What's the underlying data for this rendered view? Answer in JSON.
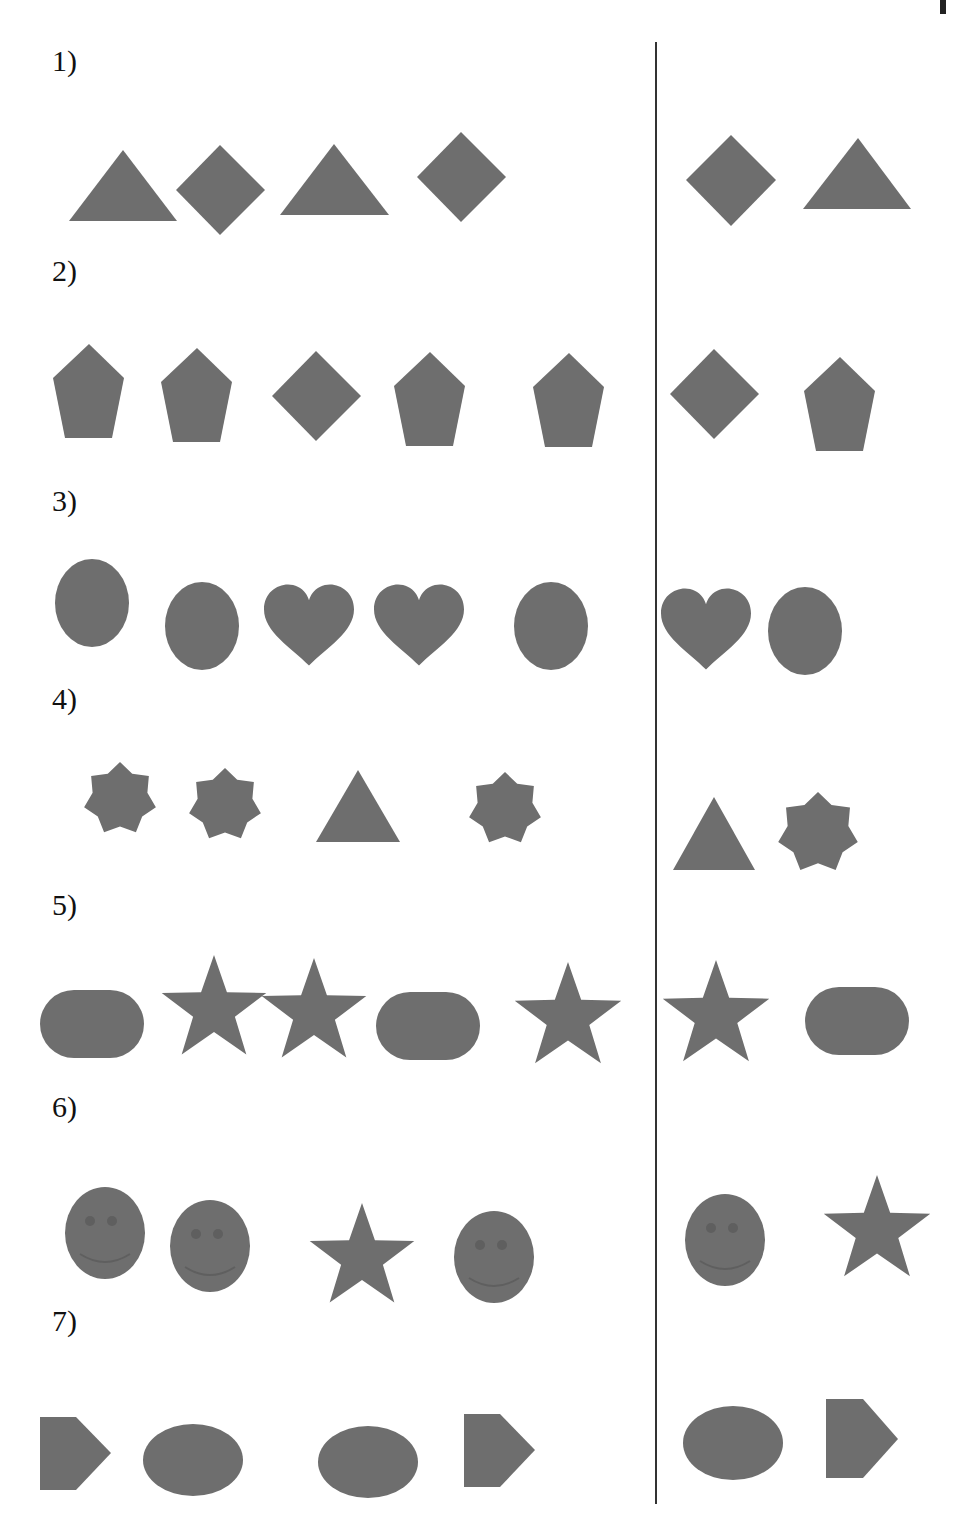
{
  "worksheet": {
    "colors": {
      "shape_fill": "#6e6e6e",
      "feature_fill": "#5f5f5f",
      "divider": "#333333"
    },
    "rows": [
      {
        "label": "1)",
        "sequence": [
          "triangle",
          "diamond",
          "triangle",
          "diamond"
        ],
        "answers": [
          "diamond",
          "triangle"
        ]
      },
      {
        "label": "2)",
        "sequence": [
          "pentagon",
          "pentagon",
          "diamond",
          "pentagon",
          "pentagon"
        ],
        "answers": [
          "diamond",
          "pentagon"
        ]
      },
      {
        "label": "3)",
        "sequence": [
          "oval",
          "oval",
          "heart",
          "heart",
          "oval"
        ],
        "answers": [
          "heart",
          "oval"
        ]
      },
      {
        "label": "4)",
        "sequence": [
          "seven-point-star",
          "seven-point-star",
          "triangle",
          "seven-point-star"
        ],
        "answers": [
          "triangle",
          "seven-point-star"
        ]
      },
      {
        "label": "5)",
        "sequence": [
          "rounded-rectangle",
          "star",
          "star",
          "rounded-rectangle",
          "star"
        ],
        "answers": [
          "star",
          "rounded-rectangle"
        ]
      },
      {
        "label": "6)",
        "sequence": [
          "smiley-face",
          "smiley-face",
          "star",
          "smiley-face"
        ],
        "answers": [
          "smiley-face",
          "star"
        ]
      },
      {
        "label": "7)",
        "sequence": [
          "pentagon-arrow",
          "ellipse",
          "ellipse",
          "pentagon-arrow"
        ],
        "answers": [
          "ellipse",
          "pentagon-arrow"
        ]
      }
    ]
  }
}
